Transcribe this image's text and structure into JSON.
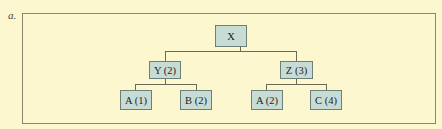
{
  "figure": {
    "label": "a.",
    "background_color": "#fdf7cf",
    "node_fill_color": "#c8dcd6"
  },
  "tree": {
    "root": {
      "label": "X"
    },
    "level1": [
      {
        "label": "Y (2)"
      },
      {
        "label": "Z (3)"
      }
    ],
    "level2": [
      {
        "label": "A (1)",
        "parent": "Y (2)"
      },
      {
        "label": "B (2)",
        "parent": "Y (2)"
      },
      {
        "label": "A (2)",
        "parent": "Z (3)"
      },
      {
        "label": "C (4)",
        "parent": "Z (3)"
      }
    ]
  }
}
